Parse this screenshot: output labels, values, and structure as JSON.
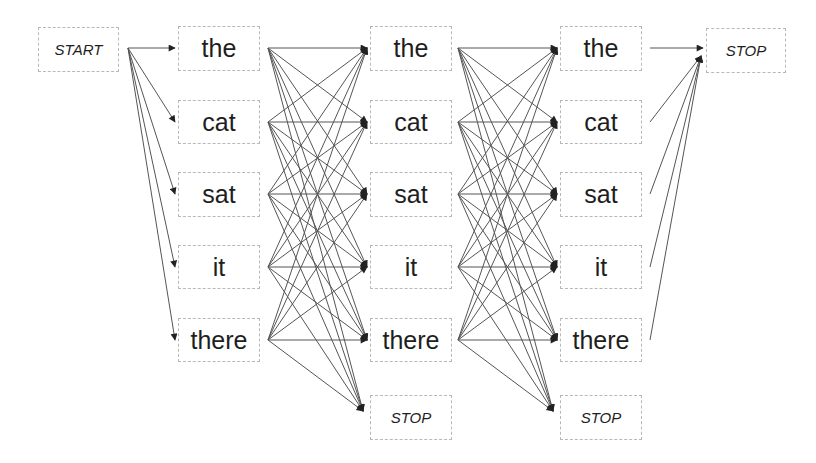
{
  "diagram": {
    "type": "lattice",
    "start_label": "START",
    "stop_label": "STOP",
    "columns": [
      {
        "nodes": [
          "the",
          "cat",
          "sat",
          "it",
          "there"
        ],
        "has_stop": false
      },
      {
        "nodes": [
          "the",
          "cat",
          "sat",
          "it",
          "there"
        ],
        "has_stop": true
      },
      {
        "nodes": [
          "the",
          "cat",
          "sat",
          "it",
          "there"
        ],
        "has_stop": true
      }
    ],
    "edges_description": "START connects to every word in column 1; every word in column k connects to every word and STOP in column k+1; every word in column 3 connects to final STOP",
    "colors": {
      "edge": "#444444",
      "border": "#b8b8b8",
      "text": "#1e1e1e"
    }
  }
}
